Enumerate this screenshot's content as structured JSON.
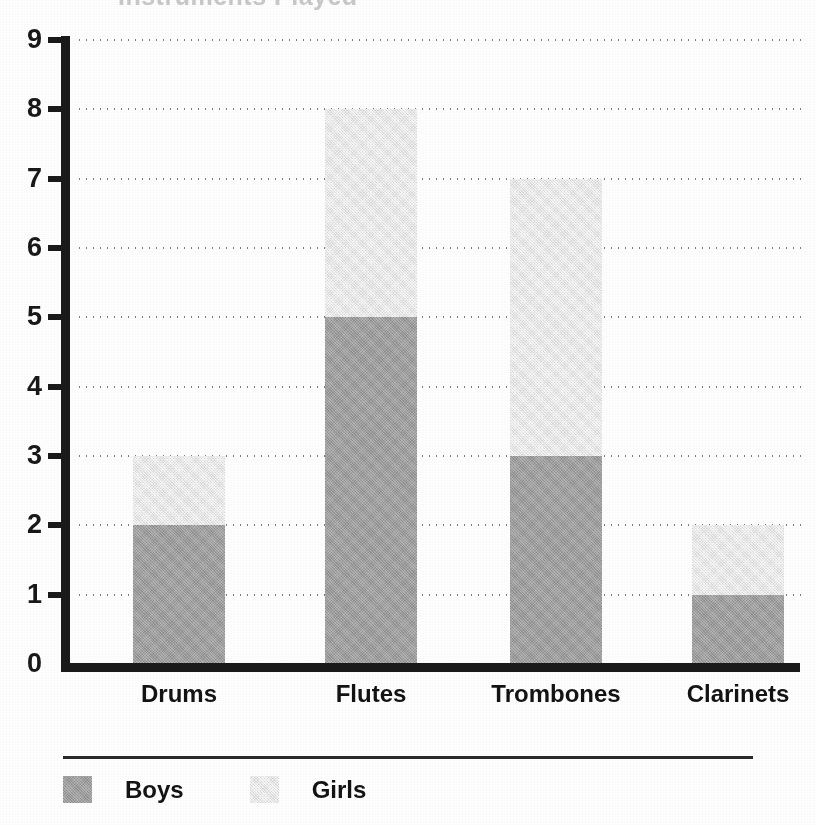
{
  "title_remnant": "Instruments Played",
  "chart_data": {
    "type": "bar",
    "subtype": "stacked-bar",
    "title": "",
    "xlabel": "",
    "ylabel": "",
    "categories": [
      "Drums",
      "Flutes",
      "Trombones",
      "Clarinets"
    ],
    "series": [
      {
        "name": "Boys",
        "values": [
          2,
          5,
          3,
          1
        ],
        "color": "#9d9d9d"
      },
      {
        "name": "Girls",
        "values": [
          1,
          3,
          4,
          1
        ],
        "color": "#e9e9e9"
      }
    ],
    "totals": [
      3,
      8,
      7,
      2
    ],
    "ylim": [
      0,
      9
    ],
    "y_ticks": [
      0,
      1,
      2,
      3,
      4,
      5,
      6,
      7,
      8,
      9
    ],
    "y_tick_labels": [
      "0",
      "1",
      "2",
      "3",
      "4",
      "5",
      "6",
      "7",
      "8",
      "9"
    ],
    "grid": true,
    "grid_style": "dotted-horizontal",
    "legend_position": "bottom-left",
    "legend_entries": [
      "Boys",
      "Girls"
    ],
    "axis_color": "#1a1a1a"
  },
  "legend": {
    "items": [
      {
        "label": "Boys",
        "swatch": "boys"
      },
      {
        "label": "Girls",
        "swatch": "girls"
      }
    ]
  }
}
